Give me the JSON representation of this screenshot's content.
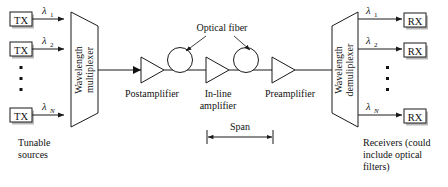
{
  "diagram": {
    "colors": {
      "line": "#1a1a1a",
      "text": "#111111",
      "background": "#ffffff",
      "shadow": "#b9b9b9"
    },
    "transmitters": {
      "label": "TX",
      "caption_line1": "Tunable",
      "caption_line2": "sources",
      "channels": [
        {
          "lambda": "λ",
          "sub": "1"
        },
        {
          "lambda": "λ",
          "sub": "2"
        },
        {
          "lambda": "λ",
          "sub": "N"
        }
      ],
      "ellipsis": "vertical-dots"
    },
    "multiplexer": {
      "line1": "Wavelength",
      "line2": "multiplexer"
    },
    "amplifiers": [
      {
        "name": "postamplifier",
        "line1": "Postamplifier",
        "line2": ""
      },
      {
        "name": "in-line-amplifier",
        "line1": "In-line",
        "line2": "amplifier"
      },
      {
        "name": "preamplifier",
        "line1": "Preamplifier",
        "line2": ""
      }
    ],
    "optical_fiber": {
      "label": "Optical fiber",
      "count": 2
    },
    "span": {
      "label": "Span"
    },
    "demultiplexer": {
      "line1": "Wavelength",
      "line2": "demuliplexer"
    },
    "receivers": {
      "label": "RX",
      "caption_line1": "Receivers (could",
      "caption_line2": "include optical",
      "caption_line3": "filters)",
      "channels": [
        {
          "lambda": "λ",
          "sub": "1"
        },
        {
          "lambda": "λ",
          "sub": "2"
        },
        {
          "lambda": "λ",
          "sub": "N"
        }
      ],
      "ellipsis": "vertical-dots"
    }
  }
}
